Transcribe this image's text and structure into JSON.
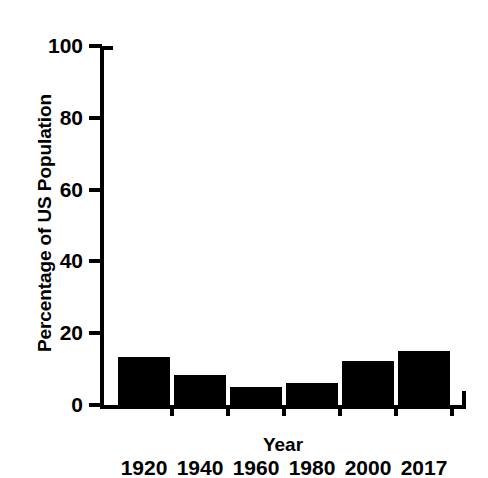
{
  "chart_data": {
    "type": "bar",
    "title": "",
    "xlabel": "Year",
    "ylabel": "Percentage of US Population",
    "categories": [
      "1920",
      "1940",
      "1960",
      "1980",
      "2000",
      "2017"
    ],
    "values": [
      13.4,
      8.4,
      5.0,
      6.1,
      12.3,
      15.0
    ],
    "ylim": [
      0,
      100
    ],
    "ytick_labels": [
      "0",
      "20",
      "40",
      "60",
      "80",
      "100"
    ],
    "ytick_values": [
      0,
      20,
      40,
      60,
      80,
      100
    ],
    "grid": false,
    "legend": false,
    "bar_color": "#000000",
    "background_color": "#ffffff",
    "axis_color": "#000000"
  }
}
